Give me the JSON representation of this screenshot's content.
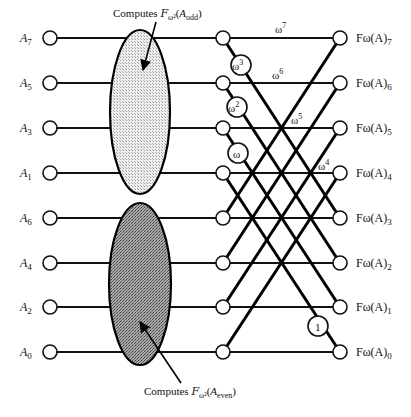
{
  "diagram": {
    "inputs": [
      {
        "label": "A",
        "index": "7",
        "y": 38
      },
      {
        "label": "A",
        "index": "5",
        "y": 83
      },
      {
        "label": "A",
        "index": "3",
        "y": 128
      },
      {
        "label": "A",
        "index": "1",
        "y": 173
      },
      {
        "label": "A",
        "index": "6",
        "y": 218
      },
      {
        "label": "A",
        "index": "4",
        "y": 263
      },
      {
        "label": "A",
        "index": "2",
        "y": 307
      },
      {
        "label": "A",
        "index": "0",
        "y": 352
      }
    ],
    "outputs": [
      {
        "label": "Fω(A)",
        "index": "7",
        "y": 38
      },
      {
        "label": "Fω(A)",
        "index": "6",
        "y": 83
      },
      {
        "label": "Fω(A)",
        "index": "5",
        "y": 128
      },
      {
        "label": "Fω(A)",
        "index": "4",
        "y": 173
      },
      {
        "label": "Fω(A)",
        "index": "3",
        "y": 218
      },
      {
        "label": "Fω(A)",
        "index": "2",
        "y": 263
      },
      {
        "label": "Fω(A)",
        "index": "1",
        "y": 307
      },
      {
        "label": "Fω(A)",
        "index": "0",
        "y": 352
      }
    ],
    "blocks": {
      "odd": {
        "caption_prefix": "Computes ",
        "func": "F",
        "func_sub": "ω²",
        "arg": "A",
        "arg_sub": "odd",
        "fill": "#e2e2e2"
      },
      "even": {
        "caption_prefix": "Computes ",
        "func": "F",
        "func_sub": "ω²",
        "arg": "A",
        "arg_sub": "even",
        "fill": "#8c8c8c"
      }
    },
    "twiddle_circles": [
      {
        "base": "ω",
        "exp": "3"
      },
      {
        "base": "ω",
        "exp": "2"
      },
      {
        "base": "ω",
        "exp": ""
      },
      {
        "base": "1",
        "exp": ""
      }
    ],
    "edge_labels": [
      {
        "base": "ω",
        "exp": "7"
      },
      {
        "base": "ω",
        "exp": "6"
      },
      {
        "base": "ω",
        "exp": "5"
      },
      {
        "base": "ω",
        "exp": "4"
      }
    ]
  }
}
